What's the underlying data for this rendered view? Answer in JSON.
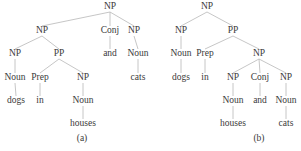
{
  "diagram": {
    "type": "parse-trees",
    "line_color": "#b8b8b8",
    "text_color": "#3a3a3a",
    "trees": [
      {
        "caption": "(a)",
        "caption_pos": [
          82,
          139
        ],
        "nodes": [
          {
            "id": "a0",
            "label": "NP",
            "x": 110,
            "y": 7
          },
          {
            "id": "a1",
            "label": "NP",
            "x": 42,
            "y": 31,
            "parent": "a0"
          },
          {
            "id": "a2",
            "label": "Conj",
            "x": 110,
            "y": 31,
            "parent": "a0"
          },
          {
            "id": "a3",
            "label": "NP",
            "x": 134,
            "y": 31,
            "parent": "a0"
          },
          {
            "id": "a4",
            "label": "NP",
            "x": 15,
            "y": 54,
            "parent": "a1"
          },
          {
            "id": "a5",
            "label": "PP",
            "x": 59,
            "y": 54,
            "parent": "a1"
          },
          {
            "id": "a6",
            "label": "and",
            "x": 110,
            "y": 54,
            "parent": "a2"
          },
          {
            "id": "a7",
            "label": "Noun",
            "x": 138,
            "y": 54,
            "parent": "a3"
          },
          {
            "id": "a8",
            "label": "Noun",
            "x": 15,
            "y": 78,
            "parent": "a4"
          },
          {
            "id": "a9",
            "label": "Prep",
            "x": 40,
            "y": 78,
            "parent": "a5"
          },
          {
            "id": "a10",
            "label": "NP",
            "x": 83,
            "y": 78,
            "parent": "a5"
          },
          {
            "id": "a11",
            "label": "cats",
            "x": 138,
            "y": 78,
            "parent": "a7"
          },
          {
            "id": "a12",
            "label": "dogs",
            "x": 16,
            "y": 101,
            "parent": "a8"
          },
          {
            "id": "a13",
            "label": "in",
            "x": 40,
            "y": 101,
            "parent": "a9"
          },
          {
            "id": "a14",
            "label": "Noun",
            "x": 83,
            "y": 101,
            "parent": "a10"
          },
          {
            "id": "a15",
            "label": "houses",
            "x": 83,
            "y": 124,
            "parent": "a14"
          }
        ]
      },
      {
        "caption": "(b)",
        "caption_pos": [
          259,
          139
        ],
        "nodes": [
          {
            "id": "b0",
            "label": "NP",
            "x": 207,
            "y": 7
          },
          {
            "id": "b1",
            "label": "NP",
            "x": 181,
            "y": 31,
            "parent": "b0"
          },
          {
            "id": "b2",
            "label": "PP",
            "x": 233,
            "y": 31,
            "parent": "b0"
          },
          {
            "id": "b3",
            "label": "Noun",
            "x": 181,
            "y": 54,
            "parent": "b1"
          },
          {
            "id": "b4",
            "label": "Prep",
            "x": 205,
            "y": 54,
            "parent": "b2"
          },
          {
            "id": "b5",
            "label": "NP",
            "x": 259,
            "y": 54,
            "parent": "b2"
          },
          {
            "id": "b6",
            "label": "dogs",
            "x": 181,
            "y": 78,
            "parent": "b3"
          },
          {
            "id": "b7",
            "label": "in",
            "x": 205,
            "y": 78,
            "parent": "b4"
          },
          {
            "id": "b8",
            "label": "NP",
            "x": 233,
            "y": 78,
            "parent": "b5"
          },
          {
            "id": "b9",
            "label": "Conj",
            "x": 260,
            "y": 78,
            "parent": "b5"
          },
          {
            "id": "b10",
            "label": "NP",
            "x": 286,
            "y": 78,
            "parent": "b5"
          },
          {
            "id": "b11",
            "label": "Noun",
            "x": 233,
            "y": 101,
            "parent": "b8"
          },
          {
            "id": "b12",
            "label": "and",
            "x": 260,
            "y": 101,
            "parent": "b9"
          },
          {
            "id": "b13",
            "label": "Noun",
            "x": 286,
            "y": 101,
            "parent": "b10"
          },
          {
            "id": "b14",
            "label": "houses",
            "x": 233,
            "y": 124,
            "parent": "b11"
          },
          {
            "id": "b15",
            "label": "cats",
            "x": 286,
            "y": 124,
            "parent": "b13"
          }
        ]
      }
    ]
  }
}
